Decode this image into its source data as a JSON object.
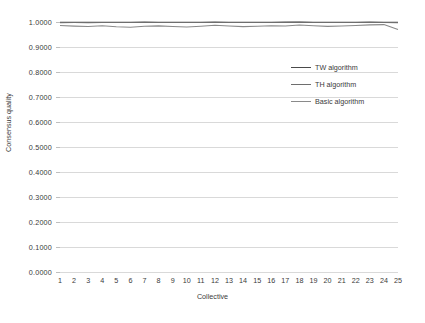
{
  "chart_data": {
    "type": "line",
    "title": "",
    "xlabel": "Collective",
    "ylabel": "Consensus quality",
    "xlim": [
      1,
      25
    ],
    "ylim": [
      0.0,
      1.0
    ],
    "grid": true,
    "legend_position": "inside-top-right",
    "x": [
      1,
      2,
      3,
      4,
      5,
      6,
      7,
      8,
      9,
      10,
      11,
      12,
      13,
      14,
      15,
      16,
      17,
      18,
      19,
      20,
      21,
      22,
      23,
      24,
      25
    ],
    "ytick_labels": [
      "0.0000",
      "0.1000",
      "0.2000",
      "0.3000",
      "0.4000",
      "0.5000",
      "0.6000",
      "0.7000",
      "0.8000",
      "0.9000",
      "1.0000"
    ],
    "ytick_values": [
      0.0,
      0.1,
      0.2,
      0.3,
      0.4,
      0.5,
      0.6,
      0.7,
      0.8,
      0.9,
      1.0
    ],
    "xtick_labels": [
      "1",
      "2",
      "3",
      "4",
      "5",
      "6",
      "7",
      "8",
      "9",
      "10",
      "11",
      "12",
      "13",
      "14",
      "15",
      "16",
      "17",
      "18",
      "19",
      "20",
      "21",
      "22",
      "23",
      "24",
      "25"
    ],
    "series": [
      {
        "name": "TW algorithm",
        "color": "#4a4a4a",
        "values": [
          0.999,
          0.9992,
          0.9991,
          0.9993,
          0.999,
          0.9992,
          0.9994,
          0.9991,
          0.9993,
          0.9992,
          0.999,
          0.9994,
          0.9992,
          0.9991,
          0.9993,
          0.9992,
          0.9994,
          0.9995,
          0.9993,
          0.9992,
          0.9991,
          0.9993,
          0.9994,
          0.9992,
          0.999
        ]
      },
      {
        "name": "TH algorithm",
        "color": "#6e6e6e",
        "values": [
          0.9975,
          0.9978,
          0.9976,
          0.998,
          0.9977,
          0.9979,
          0.9982,
          0.9978,
          0.998,
          0.9979,
          0.9977,
          0.9983,
          0.998,
          0.9978,
          0.9981,
          0.9979,
          0.9982,
          0.9984,
          0.9981,
          0.9979,
          0.9978,
          0.9981,
          0.9983,
          0.998,
          0.9976
        ]
      },
      {
        "name": "Basic algorithm",
        "color": "#8a8a8a",
        "values": [
          0.986,
          0.9835,
          0.982,
          0.9848,
          0.9812,
          0.979,
          0.9828,
          0.9845,
          0.9818,
          0.98,
          0.9832,
          0.9872,
          0.9842,
          0.9815,
          0.9828,
          0.985,
          0.9838,
          0.988,
          0.9852,
          0.9825,
          0.9838,
          0.9862,
          0.9885,
          0.9896,
          0.97
        ]
      }
    ]
  },
  "legend": {
    "items": [
      {
        "label": "TW algorithm"
      },
      {
        "label": "TH algorithm"
      },
      {
        "label": "Basic algorithm"
      }
    ]
  }
}
